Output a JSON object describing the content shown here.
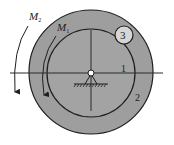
{
  "diagram": {
    "title": "",
    "colors": {
      "background": "#ffffff",
      "disc_fill": "#9e9e9e",
      "stroke": "#1e1e1e",
      "roller_fill": "#d6d6d6"
    },
    "moments": [
      {
        "symbol": "M",
        "subscript": "2",
        "direction": "clockwise-down"
      },
      {
        "symbol": "M",
        "subscript": "1",
        "direction": "clockwise-down"
      }
    ],
    "bodies": [
      {
        "id": "1",
        "label": "1",
        "type": "inner disc"
      },
      {
        "id": "2",
        "label": "2",
        "type": "outer ring"
      },
      {
        "id": "3",
        "label": "3",
        "type": "roller"
      }
    ],
    "support": {
      "type": "pin-support"
    }
  }
}
